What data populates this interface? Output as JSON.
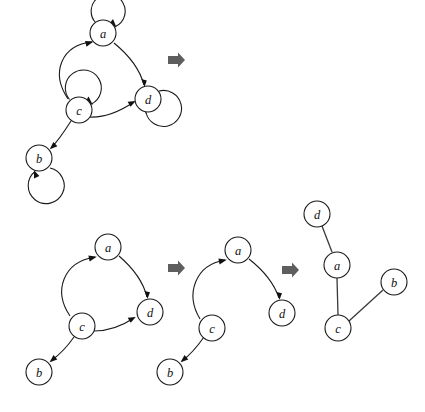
{
  "figure": {
    "background_color": "#ffffff",
    "stroke_color": "#1a1a1a",
    "step_arrow_color": "#5e5e5e",
    "node_radius": 13,
    "node_labels": [
      "a",
      "b",
      "c",
      "d"
    ],
    "graphs": [
      {
        "id": "graph-1",
        "kind": "directed",
        "caption": "",
        "nodes": [
          {
            "id": "a",
            "label": "a",
            "x": 103,
            "y": 33
          },
          {
            "id": "c",
            "label": "c",
            "x": 79,
            "y": 110
          },
          {
            "id": "d",
            "label": "d",
            "x": 148,
            "y": 99
          },
          {
            "id": "b",
            "label": "b",
            "x": 39,
            "y": 158
          }
        ],
        "edges": [
          {
            "from": "c",
            "to": "a"
          },
          {
            "from": "a",
            "to": "d"
          },
          {
            "from": "c",
            "to": "d"
          },
          {
            "from": "c",
            "to": "b"
          }
        ],
        "self_loops": [
          "a",
          "c",
          "d",
          "b"
        ]
      },
      {
        "id": "graph-2",
        "kind": "directed",
        "caption": "",
        "nodes": [
          {
            "id": "a",
            "label": "a",
            "x": 108,
            "y": 247
          },
          {
            "id": "c",
            "label": "c",
            "x": 82,
            "y": 326
          },
          {
            "id": "d",
            "label": "d",
            "x": 150,
            "y": 312
          },
          {
            "id": "b",
            "label": "b",
            "x": 39,
            "y": 372
          }
        ],
        "edges": [
          {
            "from": "c",
            "to": "a"
          },
          {
            "from": "a",
            "to": "d"
          },
          {
            "from": "c",
            "to": "d"
          },
          {
            "from": "c",
            "to": "b"
          }
        ],
        "self_loops": []
      },
      {
        "id": "graph-3",
        "kind": "directed",
        "caption": "",
        "nodes": [
          {
            "id": "a",
            "label": "a",
            "x": 238,
            "y": 250
          },
          {
            "id": "c",
            "label": "c",
            "x": 212,
            "y": 328
          },
          {
            "id": "d",
            "label": "d",
            "x": 282,
            "y": 313
          },
          {
            "id": "b",
            "label": "b",
            "x": 170,
            "y": 372
          }
        ],
        "edges": [
          {
            "from": "c",
            "to": "a"
          },
          {
            "from": "a",
            "to": "d"
          },
          {
            "from": "c",
            "to": "b"
          }
        ],
        "self_loops": []
      },
      {
        "id": "graph-4",
        "kind": "undirected",
        "caption": "",
        "nodes": [
          {
            "id": "d",
            "label": "d",
            "x": 317,
            "y": 214
          },
          {
            "id": "a",
            "label": "a",
            "x": 337,
            "y": 265
          },
          {
            "id": "c",
            "label": "c",
            "x": 338,
            "y": 328
          },
          {
            "id": "b",
            "label": "b",
            "x": 394,
            "y": 282
          }
        ],
        "edges": [
          {
            "from": "d",
            "to": "a"
          },
          {
            "from": "a",
            "to": "c"
          },
          {
            "from": "c",
            "to": "b"
          }
        ],
        "self_loops": []
      }
    ],
    "step_arrows": [
      {
        "id": "step-arrow-1",
        "x": 176,
        "y": 60
      },
      {
        "id": "step-arrow-2",
        "x": 176,
        "y": 268
      },
      {
        "id": "step-arrow-3",
        "x": 290,
        "y": 270
      }
    ]
  }
}
